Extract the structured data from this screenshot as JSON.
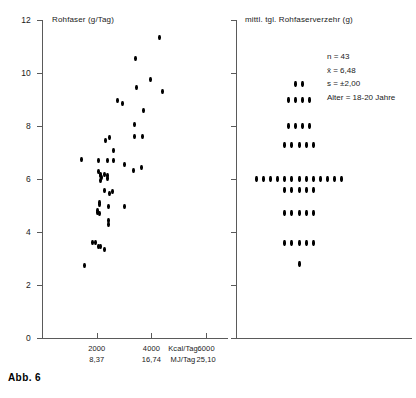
{
  "figure": {
    "caption": "Abb. 6"
  },
  "chart_data": [
    {
      "type": "scatter",
      "panel": "left",
      "title": "Rohfaser (g/Tag)",
      "ylabel": "Rohfaser (g/Tag)",
      "xlabel": "Kcal/Tag",
      "xlabel_secondary": "MJ/Tag",
      "ylim": [
        0,
        12
      ],
      "xlim": [
        0,
        6800
      ],
      "yticks": [
        0,
        2,
        4,
        6,
        8,
        10,
        12
      ],
      "ytick_labels": [
        "0",
        "2",
        "4",
        "6",
        "8",
        "10",
        "12"
      ],
      "xticks": [
        2000,
        4000,
        6000
      ],
      "xtick_labels": [
        "2000",
        "4000",
        "6000"
      ],
      "xtick_labels_secondary": [
        "8,37",
        "16,74",
        "25,10"
      ],
      "grid": false,
      "legend": "none",
      "points": [
        [
          1560,
          2.72
        ],
        [
          1430,
          6.72
        ],
        [
          1840,
          3.62
        ],
        [
          1950,
          3.6
        ],
        [
          2060,
          3.45
        ],
        [
          2140,
          3.45
        ],
        [
          2290,
          3.35
        ],
        [
          2020,
          4.8
        ],
        [
          2030,
          4.72
        ],
        [
          2100,
          5.1
        ],
        [
          2120,
          5.05
        ],
        [
          2110,
          4.7
        ],
        [
          2420,
          4.3
        ],
        [
          2430,
          4.42
        ],
        [
          2440,
          4.95
        ],
        [
          2280,
          5.55
        ],
        [
          2450,
          5.45
        ],
        [
          2560,
          5.52
        ],
        [
          2380,
          6.02
        ],
        [
          2390,
          6.12
        ],
        [
          3010,
          4.95
        ],
        [
          2080,
          6.28
        ],
        [
          2130,
          6.12
        ],
        [
          2140,
          6.18
        ],
        [
          2160,
          6.05
        ],
        [
          2290,
          6.18
        ],
        [
          2155,
          5.95
        ],
        [
          2050,
          6.7
        ],
        [
          2390,
          6.7
        ],
        [
          2600,
          6.68
        ],
        [
          3000,
          6.55
        ],
        [
          3350,
          6.32
        ],
        [
          3640,
          6.45
        ],
        [
          2330,
          7.45
        ],
        [
          2470,
          7.58
        ],
        [
          2620,
          7.08
        ],
        [
          3390,
          7.62
        ],
        [
          3660,
          7.6
        ],
        [
          3370,
          8.05
        ],
        [
          3700,
          8.6
        ],
        [
          2770,
          8.95
        ],
        [
          2940,
          8.85
        ],
        [
          3440,
          9.45
        ],
        [
          4390,
          9.32
        ],
        [
          3980,
          9.75
        ],
        [
          3430,
          10.55
        ],
        [
          4300,
          11.35
        ]
      ]
    },
    {
      "type": "dot-histogram",
      "panel": "right",
      "title": "mittl. tgl. Rohfaserverzehr (g)",
      "ylim": [
        0,
        12
      ],
      "yticks": [
        0,
        2,
        4,
        6,
        8,
        10,
        12
      ],
      "grid": false,
      "legend": "none",
      "bins": [
        {
          "value": 9.6,
          "count": 2
        },
        {
          "value": 9.0,
          "count": 4
        },
        {
          "value": 8.0,
          "count": 4
        },
        {
          "value": 7.3,
          "count": 5
        },
        {
          "value": 6.0,
          "count": 13
        },
        {
          "value": 5.6,
          "count": 5
        },
        {
          "value": 4.7,
          "count": 5
        },
        {
          "value": 3.6,
          "count": 5
        },
        {
          "value": 2.8,
          "count": 1
        }
      ],
      "stats": {
        "n": "n = 43",
        "mean": "x̄ = 6,48",
        "sd": "s = ±2,00",
        "age": "Alter = 18-20 Jahre"
      }
    }
  ]
}
